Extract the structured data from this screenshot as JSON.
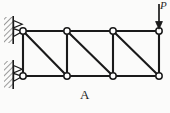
{
  "figure": {
    "caption": "A",
    "load_label": "P",
    "colors": {
      "line": "#1a1a1a",
      "node_fill": "#ffffff",
      "hatch": "#555555",
      "background": "#fbfbfa"
    },
    "geometry": {
      "top_chord_y": 31,
      "bottom_chord_y": 76,
      "node_x": [
        23,
        67,
        113,
        159
      ],
      "node_radius": 3.2
    },
    "structure": {
      "type": "cantilever-truss",
      "panels": 3,
      "top_nodes": [
        {
          "id": "T1",
          "x": 23,
          "y": 31
        },
        {
          "id": "T2",
          "x": 67,
          "y": 31
        },
        {
          "id": "T3",
          "x": 113,
          "y": 31
        },
        {
          "id": "T4",
          "x": 159,
          "y": 31
        }
      ],
      "bottom_nodes": [
        {
          "id": "B1",
          "x": 23,
          "y": 76
        },
        {
          "id": "B2",
          "x": 67,
          "y": 76
        },
        {
          "id": "B3",
          "x": 113,
          "y": 76
        },
        {
          "id": "B4",
          "x": 159,
          "y": 76
        }
      ],
      "top_chord_members": [
        "T1-T2",
        "T2-T3",
        "T3-T4"
      ],
      "bottom_chord_members": [
        "B1-B2",
        "B2-B3",
        "B3-B4"
      ],
      "vertical_members": [
        "T1-B1",
        "T2-B2",
        "T3-B3",
        "T4-B4"
      ],
      "diagonal_members": [
        "T1-B2",
        "T2-B3",
        "T3-B4"
      ]
    },
    "supports": [
      {
        "id": "support-top",
        "kind": "pin",
        "node": "T1",
        "wall_x": 4,
        "wall_y": 17,
        "wall_width": 9,
        "wall_height": 26
      },
      {
        "id": "support-bottom",
        "kind": "pin",
        "node": "B1",
        "wall_x": 4,
        "wall_y": 61,
        "wall_width": 9,
        "wall_height": 27
      }
    ],
    "load": {
      "id": "point-load-P",
      "direction": "down",
      "applied_at": "T4",
      "arrow_x": 159,
      "arrow_top_y": 4,
      "arrow_tip_y": 29
    }
  }
}
